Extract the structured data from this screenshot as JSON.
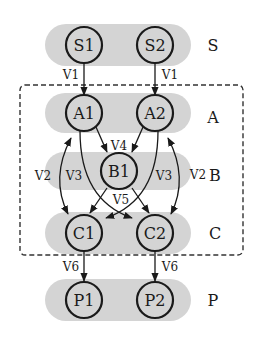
{
  "diagram": {
    "rows": [
      {
        "id": "S",
        "label": "S",
        "nodes": [
          "S1",
          "S2"
        ]
      },
      {
        "id": "A",
        "label": "A",
        "nodes": [
          "A1",
          "A2"
        ]
      },
      {
        "id": "B",
        "label": "B",
        "nodes": [
          "B1"
        ]
      },
      {
        "id": "C",
        "label": "C",
        "nodes": [
          "C1",
          "C2"
        ]
      },
      {
        "id": "P",
        "label": "P",
        "nodes": [
          "P1",
          "P2"
        ]
      }
    ],
    "nodes": {
      "S1": "S1",
      "S2": "S2",
      "A1": "A1",
      "A2": "A2",
      "B1": "B1",
      "C1": "C1",
      "C2": "C2",
      "P1": "P1",
      "P2": "P2"
    },
    "row_labels": {
      "S": "S",
      "A": "A",
      "B": "B",
      "C": "C",
      "P": "P"
    },
    "edge_labels": {
      "v1_left": "V1",
      "v1_right": "V1",
      "v2_left": "V2",
      "v2_right": "V2",
      "v3_left": "V3",
      "v3_right": "V3",
      "v4": "V4",
      "v5": "V5",
      "v6_left": "V6",
      "v6_right": "V6"
    },
    "edges": [
      {
        "from": "S1",
        "to": "A1",
        "label": "V1"
      },
      {
        "from": "S2",
        "to": "A2",
        "label": "V1"
      },
      {
        "from": "A1",
        "to": "C1",
        "label": "V2",
        "bidirectional": true
      },
      {
        "from": "A2",
        "to": "C2",
        "label": "V2",
        "bidirectional": true
      },
      {
        "from": "A1",
        "to": "C2",
        "label": "V3"
      },
      {
        "from": "A2",
        "to": "C1",
        "label": "V3"
      },
      {
        "from": "A1",
        "to": "B1",
        "label": "V4"
      },
      {
        "from": "A2",
        "to": "B1",
        "label": "V4"
      },
      {
        "from": "B1",
        "to": "C1",
        "label": "V5"
      },
      {
        "from": "B1",
        "to": "C2",
        "label": "V5"
      },
      {
        "from": "C1",
        "to": "P1",
        "label": "V6"
      },
      {
        "from": "C2",
        "to": "P2",
        "label": "V6"
      }
    ],
    "group_box": {
      "rows": [
        "A",
        "B",
        "C"
      ],
      "style": "dashed"
    }
  }
}
